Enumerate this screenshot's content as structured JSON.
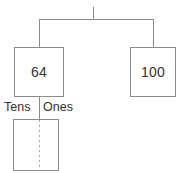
{
  "diagram": {
    "type": "number-bond-place-value",
    "colors": {
      "stroke": "#8c8c8c",
      "text": "#333333",
      "divider": "#a8a8a8",
      "background": "#ffffff"
    },
    "top_connector": {
      "tick_label": "",
      "has_center_tick": true
    },
    "nodes": [
      {
        "id": "left",
        "value": "64",
        "name": "number-box-64"
      },
      {
        "id": "right",
        "value": "100",
        "name": "number-box-100"
      }
    ],
    "place_value_chart": {
      "columns": [
        {
          "label": "Tens",
          "value": ""
        },
        {
          "label": "Ones",
          "value": ""
        }
      ]
    }
  }
}
